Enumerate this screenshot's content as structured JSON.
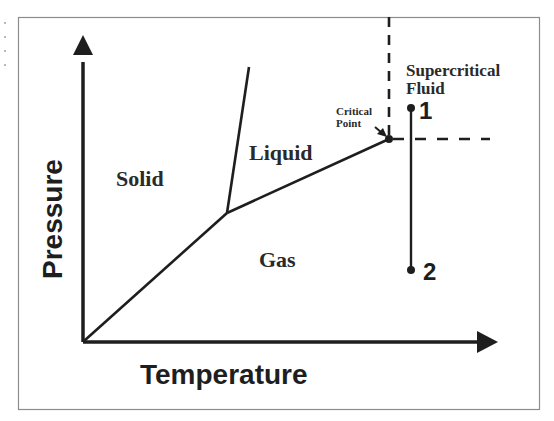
{
  "diagram": {
    "type": "phase-diagram",
    "axes": {
      "x_label": "Temperature",
      "y_label": "Pressure"
    },
    "regions": {
      "solid": "Solid",
      "liquid": "Liquid",
      "gas": "Gas",
      "supercritical_line1": "Supercritical",
      "supercritical_line2": "Fluid"
    },
    "annotations": {
      "critical_point_line1": "Critical",
      "critical_point_line2": "Point"
    },
    "points": {
      "p1": "1",
      "p2": "2"
    },
    "colors": {
      "line": "#1e1e1e",
      "frame": "#8c8c8c",
      "background": "#ffffff"
    }
  }
}
